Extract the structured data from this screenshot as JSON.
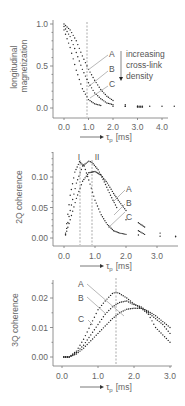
{
  "chart_data": [
    {
      "type": "scatter",
      "title": "",
      "ylabel": "longitudinal magnetization",
      "xlabel": "τp [ms]",
      "x_arrow": true,
      "ylim": [
        0.0,
        1.0
      ],
      "xlim": [
        0.0,
        4.5
      ],
      "yticks": [
        "0.0",
        "0.5",
        "1.0"
      ],
      "xticks": [
        "0.0",
        "1.0",
        "2.0",
        "3.0",
        "4.0"
      ],
      "vline_x": 1.0,
      "annotation": "increasing cross-link density",
      "series": [
        {
          "name": "A",
          "x": [
            0.0,
            0.25,
            0.5,
            0.75,
            1.0,
            1.25,
            1.5,
            1.75,
            2.0,
            2.5,
            3.0,
            3.2
          ],
          "y": [
            1.0,
            0.93,
            0.8,
            0.62,
            0.46,
            0.33,
            0.22,
            0.14,
            0.09,
            0.04,
            0.02,
            0.02
          ]
        },
        {
          "name": "B",
          "x": [
            0.0,
            0.25,
            0.5,
            0.75,
            1.0,
            1.25,
            1.5,
            1.75,
            2.0,
            2.5,
            3.0,
            3.2
          ],
          "y": [
            0.97,
            0.85,
            0.66,
            0.46,
            0.3,
            0.18,
            0.11,
            0.06,
            0.04,
            0.02,
            0.01,
            0.01
          ]
        },
        {
          "name": "C",
          "x": [
            0.0,
            0.25,
            0.5,
            0.75,
            1.0,
            1.25,
            1.5,
            2.0,
            2.5,
            3.0,
            3.5,
            4.0,
            4.5
          ],
          "y": [
            0.93,
            0.72,
            0.45,
            0.23,
            0.1,
            0.05,
            0.03,
            0.02,
            0.02,
            0.02,
            0.02,
            0.02,
            0.02
          ]
        }
      ]
    },
    {
      "type": "scatter",
      "title": "",
      "ylabel": "2Q coherence",
      "xlabel": "τp [ms]",
      "x_arrow": true,
      "ylim": [
        0.0,
        0.13
      ],
      "xlim": [
        0.0,
        3.7
      ],
      "yticks": [
        "0.00",
        "0.05",
        "0.10"
      ],
      "xticks": [
        "0.0",
        "1.0",
        "2.0",
        "3.0"
      ],
      "vlines": [
        {
          "label": "I",
          "x": 0.5
        },
        {
          "label": "II",
          "x": 0.9
        }
      ],
      "series": [
        {
          "name": "A",
          "x": [
            0.05,
            0.2,
            0.4,
            0.6,
            0.8,
            1.0,
            1.2,
            1.4,
            1.6,
            1.75,
            2.0,
            2.4,
            2.6,
            3.1,
            3.6
          ],
          "y": [
            0.005,
            0.03,
            0.065,
            0.093,
            0.107,
            0.109,
            0.103,
            0.09,
            0.073,
            0.062,
            0.045,
            0.025,
            0.018,
            0.008,
            0.003
          ]
        },
        {
          "name": "B",
          "x": [
            0.05,
            0.2,
            0.4,
            0.6,
            0.8,
            0.9,
            1.1,
            1.3,
            1.5,
            1.7,
            2.0,
            2.4,
            2.6,
            3.1,
            3.6
          ],
          "y": [
            0.006,
            0.045,
            0.09,
            0.118,
            0.126,
            0.124,
            0.112,
            0.092,
            0.07,
            0.05,
            0.03,
            0.012,
            0.006,
            0.003,
            0.002
          ]
        },
        {
          "name": "C",
          "x": [
            0.05,
            0.2,
            0.35,
            0.5,
            0.65,
            0.8,
            1.0,
            1.2,
            1.4,
            1.6,
            1.8,
            2.0,
            2.4
          ],
          "y": [
            0.008,
            0.07,
            0.108,
            0.125,
            0.118,
            0.095,
            0.062,
            0.038,
            0.022,
            0.012,
            0.008,
            0.006,
            0.005
          ]
        }
      ]
    },
    {
      "type": "scatter",
      "title": "",
      "ylabel": "3Q coherence",
      "xlabel": "τp [ms]",
      "x_arrow": true,
      "ylim": [
        -0.001,
        0.025
      ],
      "xlim": [
        0.0,
        3.0
      ],
      "yticks": [
        "0.00",
        "0.01",
        "0.02"
      ],
      "xticks": [
        "0.0",
        "1.0",
        "2.0",
        "3.0"
      ],
      "vline_x": 1.5,
      "series": [
        {
          "name": "A",
          "x": [
            0.05,
            0.2,
            0.4,
            0.6,
            0.8,
            1.0,
            1.2,
            1.4,
            1.5,
            1.6,
            1.8,
            2.0,
            2.2,
            2.4,
            2.6,
            2.8,
            3.0
          ],
          "y": [
            0.0,
            0.0,
            0.002,
            0.006,
            0.011,
            0.016,
            0.019,
            0.0215,
            0.022,
            0.0215,
            0.02,
            0.018,
            0.0165,
            0.0155,
            0.014,
            0.012,
            0.01
          ]
        },
        {
          "name": "B",
          "x": [
            0.05,
            0.2,
            0.4,
            0.6,
            0.8,
            1.0,
            1.2,
            1.4,
            1.6,
            1.8,
            1.95,
            2.2,
            2.4,
            2.6,
            2.8,
            3.0
          ],
          "y": [
            0.0,
            0.0,
            0.0015,
            0.004,
            0.0075,
            0.011,
            0.0145,
            0.017,
            0.0185,
            0.019,
            0.018,
            0.017,
            0.015,
            0.013,
            0.011,
            0.008
          ]
        },
        {
          "name": "C",
          "x": [
            0.05,
            0.2,
            0.4,
            0.6,
            0.8,
            1.0,
            1.2,
            1.4,
            1.6,
            1.8,
            2.0,
            2.2,
            2.4,
            2.6,
            2.8,
            3.0
          ],
          "y": [
            0.0,
            0.0,
            0.001,
            0.003,
            0.0055,
            0.008,
            0.0105,
            0.013,
            0.015,
            0.0162,
            0.0165,
            0.0165,
            0.0145,
            0.01,
            0.0075,
            0.005
          ]
        }
      ]
    }
  ],
  "panels": {
    "p1": {
      "ylabel_line1": "longitudinal",
      "ylabel_line2": "magnetization",
      "yticks": [
        "1.0",
        "0.5",
        "0.0"
      ],
      "xticks": [
        "0.0",
        "1.0",
        "2.0",
        "3.0",
        "4.0"
      ],
      "xlabel": "τ",
      "xlabel_sub": "p",
      "xlabel_unit": "[ms]",
      "labels": [
        "A",
        "B",
        "C"
      ],
      "annot_line1": "increasing",
      "annot_line2": "cross-link",
      "annot_line3": "density"
    },
    "p2": {
      "ylabel": "2Q coherence",
      "yticks": [
        "0.10",
        "0.05",
        "0.00"
      ],
      "xticks": [
        "0.0",
        "1.0",
        "2.0",
        "3.0"
      ],
      "xlabel": "τ",
      "xlabel_sub": "p",
      "xlabel_unit": "[ms]",
      "labels": [
        "A",
        "B",
        "C"
      ],
      "vline_labels": [
        "I",
        "II"
      ]
    },
    "p3": {
      "ylabel": "3Q coherence",
      "yticks": [
        "0.02",
        "0.01",
        "0.00"
      ],
      "xticks": [
        "0.0",
        "1.0",
        "2.0",
        "3.0"
      ],
      "xlabel": "τ",
      "xlabel_sub": "p",
      "xlabel_unit": "[ms]",
      "labels": [
        "A",
        "B",
        "C"
      ]
    }
  }
}
